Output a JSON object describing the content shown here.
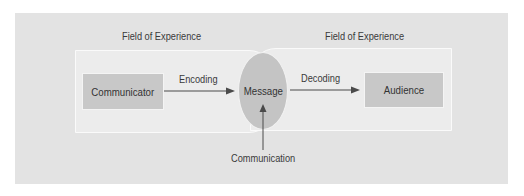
{
  "diagram": {
    "title_left": "Field of Experience",
    "title_right": "Field of Experience",
    "nodes": {
      "communicator": "Communicator",
      "message": "Message",
      "audience": "Audience"
    },
    "edges": {
      "encoding": "Encoding",
      "decoding": "Decoding",
      "communication": "Communication"
    },
    "colors": {
      "panel": "#e3e3e3",
      "field": "#ececec",
      "node": "#c8c8c8",
      "arrow": "#4a4a4a"
    }
  }
}
